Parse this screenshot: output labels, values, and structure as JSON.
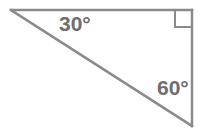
{
  "figure": {
    "type": "geometry-diagram",
    "shape": "right-triangle",
    "background_color": "#ffffff",
    "canvas": {
      "width": 201,
      "height": 140
    },
    "stroke": {
      "color": "#8a8a8a",
      "width": 2.5,
      "right_angle_marker_width": 2.0
    },
    "text_color": "#6e6e6e",
    "vertices": {
      "apex_left": {
        "x": 11,
        "y": 10
      },
      "top_right": {
        "x": 192,
        "y": 10
      },
      "bottom_right": {
        "x": 192,
        "y": 126
      }
    },
    "edges": [
      {
        "name": "top-side",
        "from": "apex_left",
        "to": "top_right"
      },
      {
        "name": "right-side",
        "from": "top_right",
        "to": "bottom_right"
      },
      {
        "name": "hypotenuse",
        "from": "apex_left",
        "to": "bottom_right"
      }
    ],
    "right_angle_marker": {
      "at_vertex": "top_right",
      "x": 175,
      "y": 10,
      "size": 17
    },
    "labels": {
      "angle_top_left": "30°",
      "angle_bottom_right": "60°",
      "right_angle": "90° (shown as square marker)"
    }
  }
}
